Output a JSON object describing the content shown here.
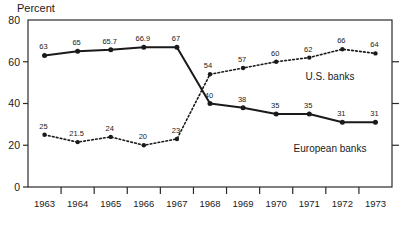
{
  "chart_data": {
    "type": "line",
    "title": "",
    "ylabel": "Percent",
    "xlabel": "",
    "ylim": [
      0,
      80
    ],
    "yticks": [
      0,
      20,
      40,
      60,
      80
    ],
    "ytick_labels": [
      "0",
      "20",
      "40",
      "60",
      "80"
    ],
    "grid": false,
    "legend": "inline-annotations",
    "categories": [
      "1963",
      "1964",
      "1965",
      "1966",
      "1967",
      "1968",
      "1969",
      "1970",
      "1971",
      "1972",
      "1973"
    ],
    "series": [
      {
        "name": "European banks",
        "style": "solid",
        "label_position": "right-lower",
        "values": [
          63,
          65,
          65.7,
          66.9,
          67,
          40,
          38,
          35,
          35,
          31,
          31
        ],
        "point_labels": [
          "63",
          "65",
          "65.7",
          "66.9",
          "67",
          "40",
          "38",
          "35",
          "35",
          "31",
          "31"
        ]
      },
      {
        "name": "U.S. banks",
        "style": "dotted",
        "label_position": "right-upper",
        "values": [
          25,
          21.5,
          24,
          20,
          23,
          54,
          57,
          60,
          62,
          66,
          64
        ],
        "point_labels": [
          "25",
          "21.5",
          "24",
          "20",
          "23",
          "54",
          "57",
          "60",
          "62",
          "66",
          "64"
        ]
      }
    ]
  },
  "colors": {
    "ink": "#1a1a1a",
    "frame": "#2b2b2b",
    "background": "#ffffff"
  }
}
